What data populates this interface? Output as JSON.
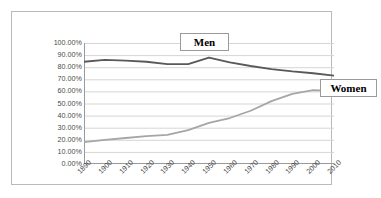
{
  "chart_data": {
    "type": "line",
    "title": "",
    "xlabel": "",
    "ylabel": "",
    "categories": [
      "1890",
      "1900",
      "1910",
      "1920",
      "1930",
      "1940",
      "1950",
      "1960",
      "1970",
      "1980",
      "1990",
      "2000",
      "2010"
    ],
    "x": [
      1890,
      1900,
      1910,
      1920,
      1930,
      1940,
      1950,
      1960,
      1970,
      1980,
      1990,
      2000,
      2010
    ],
    "xlim": [
      1890,
      2010
    ],
    "ylim": [
      0,
      100
    ],
    "y_tick_labels": [
      "100.00%",
      "90.00%",
      "80.00%",
      "70.00%",
      "60.00%",
      "50.00%",
      "40.00%",
      "30.00%",
      "20.00%",
      "10.00%",
      "0.00%"
    ],
    "y_ticks": [
      100,
      90,
      80,
      70,
      60,
      50,
      40,
      30,
      20,
      10,
      0
    ],
    "grid": true,
    "grid_axis": "y",
    "legend_position": "callout-labels",
    "series": [
      {
        "name": "Men",
        "color": "#595959",
        "values": [
          84.5,
          86.0,
          85.5,
          84.5,
          82.5,
          82.5,
          88.0,
          84.0,
          81.0,
          78.5,
          76.5,
          75.0,
          73.0
        ]
      },
      {
        "name": "Women",
        "color": "#a6a6a6",
        "values": [
          18.0,
          20.0,
          21.5,
          23.0,
          24.0,
          28.0,
          34.0,
          38.0,
          44.0,
          52.0,
          58.0,
          61.0,
          60.5
        ]
      }
    ],
    "annotations": [
      {
        "text": "Men",
        "series": "Men"
      },
      {
        "text": "Women",
        "series": "Women"
      }
    ]
  },
  "chart": {
    "callout_men": "Men",
    "callout_women": "Women"
  }
}
